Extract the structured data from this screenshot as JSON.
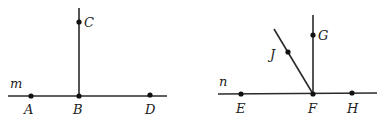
{
  "figures": [
    {
      "line_label": "m",
      "points": {
        "A": "A",
        "B": "B",
        "C": "C",
        "D": "D"
      },
      "description": "Ray BC perpendicular to line m at B; A, B, D on line m"
    },
    {
      "line_label": "n",
      "points": {
        "E": "E",
        "F": "F",
        "G": "G",
        "H": "H",
        "J": "J"
      },
      "description": "Ray FG perpendicular to line n at F; ray FJ oblique; E, F, H on line n"
    }
  ],
  "colors": {
    "stroke": "#2a2a2a",
    "point": "#111111",
    "label": "#222222",
    "background": "#ffffff"
  }
}
